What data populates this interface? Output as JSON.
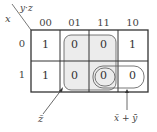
{
  "kmap": {
    "row_var": "x",
    "col_var": "y·z",
    "col_headers": [
      "00",
      "01",
      "11",
      "10"
    ],
    "row_headers": [
      "0",
      "1"
    ],
    "cells": [
      [
        "1",
        "0",
        "0",
        "1"
      ],
      [
        "1",
        "0",
        "0",
        "0"
      ]
    ],
    "groups": [
      {
        "label": "z̄",
        "cells": "column 01–11 (x=0,1), shaded"
      },
      {
        "label": "x̄ + ȳ",
        "cells": "row 1, columns 11–10"
      }
    ]
  },
  "annotations": {
    "z_bar": "z̄",
    "x_bar_plus_y_bar": "x̄ + ȳ"
  }
}
